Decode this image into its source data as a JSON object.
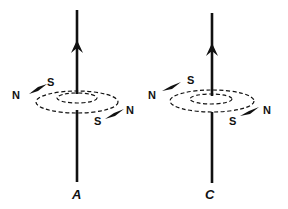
{
  "diagram": {
    "wires": [
      {
        "id": "A",
        "label": "A",
        "current_direction": "up",
        "compass_top": {
          "north": "N",
          "south": "S"
        },
        "compass_bottom": {
          "north": "N",
          "south": "S"
        }
      },
      {
        "id": "C",
        "label": "C",
        "current_direction": "up",
        "compass_top": {
          "north": "N",
          "south": "S"
        },
        "compass_bottom": {
          "north": "N",
          "south": "S"
        }
      }
    ],
    "colors": {
      "line": "#111111",
      "background": "#ffffff"
    }
  }
}
